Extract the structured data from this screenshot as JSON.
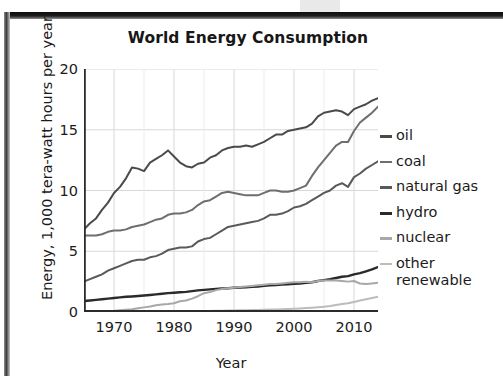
{
  "chart_data": {
    "type": "line",
    "title": "World Energy Consumption",
    "xlabel": "Year",
    "ylabel": "Energy, 1,000 tera-watt hours per year",
    "xlim": [
      1965,
      2014
    ],
    "ylim": [
      0,
      20
    ],
    "xticks": [
      "1970",
      "1980",
      "1990",
      "2000",
      "2010"
    ],
    "xtick_values": [
      1970,
      1980,
      1990,
      2000,
      2010
    ],
    "yticks": [
      "0",
      "5",
      "10",
      "15",
      "20"
    ],
    "ytick_values": [
      0,
      5,
      10,
      15,
      20
    ],
    "grid": "both",
    "legend_position": "right",
    "x": [
      1965,
      1966,
      1967,
      1968,
      1969,
      1970,
      1971,
      1972,
      1973,
      1974,
      1975,
      1976,
      1977,
      1978,
      1979,
      1980,
      1981,
      1982,
      1983,
      1984,
      1985,
      1986,
      1987,
      1988,
      1989,
      1990,
      1991,
      1992,
      1993,
      1994,
      1995,
      1996,
      1997,
      1998,
      1999,
      2000,
      2001,
      2002,
      2003,
      2004,
      2005,
      2006,
      2007,
      2008,
      2009,
      2010,
      2011,
      2012,
      2013,
      2014
    ],
    "series": [
      {
        "name": "oil",
        "color": "#4a4a4a",
        "values": [
          6.8,
          7.3,
          7.7,
          8.4,
          9.0,
          9.8,
          10.3,
          11.0,
          11.9,
          11.8,
          11.6,
          12.3,
          12.6,
          12.9,
          13.3,
          12.8,
          12.3,
          12.0,
          11.9,
          12.2,
          12.3,
          12.7,
          12.9,
          13.3,
          13.5,
          13.6,
          13.6,
          13.7,
          13.6,
          13.8,
          14.0,
          14.3,
          14.6,
          14.6,
          14.9,
          15.0,
          15.1,
          15.2,
          15.5,
          16.1,
          16.4,
          16.5,
          16.6,
          16.5,
          16.2,
          16.7,
          16.9,
          17.1,
          17.4,
          17.6
        ]
      },
      {
        "name": "coal",
        "color": "#6e6e6e",
        "values": [
          6.3,
          6.3,
          6.3,
          6.4,
          6.6,
          6.7,
          6.7,
          6.8,
          7.0,
          7.1,
          7.2,
          7.4,
          7.6,
          7.7,
          8.0,
          8.1,
          8.1,
          8.2,
          8.4,
          8.8,
          9.1,
          9.2,
          9.5,
          9.8,
          9.9,
          9.8,
          9.7,
          9.6,
          9.6,
          9.6,
          9.8,
          10.0,
          10.0,
          9.9,
          9.9,
          10.0,
          10.2,
          10.4,
          11.2,
          11.9,
          12.5,
          13.1,
          13.7,
          14.0,
          14.0,
          14.9,
          15.6,
          16.0,
          16.4,
          16.9
        ]
      },
      {
        "name": "natural gas",
        "color": "#5a5a5a",
        "values": [
          2.5,
          2.7,
          2.9,
          3.1,
          3.4,
          3.6,
          3.8,
          4.0,
          4.2,
          4.3,
          4.3,
          4.5,
          4.6,
          4.8,
          5.1,
          5.2,
          5.3,
          5.3,
          5.4,
          5.8,
          6.0,
          6.1,
          6.4,
          6.7,
          7.0,
          7.1,
          7.2,
          7.3,
          7.4,
          7.5,
          7.7,
          8.0,
          8.0,
          8.1,
          8.3,
          8.6,
          8.7,
          8.9,
          9.2,
          9.5,
          9.8,
          10.0,
          10.4,
          10.6,
          10.3,
          11.1,
          11.4,
          11.8,
          12.1,
          12.4
        ]
      },
      {
        "name": "hydro",
        "color": "#2a2a2a",
        "values": [
          0.9,
          0.95,
          1.0,
          1.05,
          1.1,
          1.15,
          1.2,
          1.25,
          1.28,
          1.32,
          1.36,
          1.4,
          1.45,
          1.5,
          1.55,
          1.58,
          1.62,
          1.66,
          1.72,
          1.78,
          1.82,
          1.86,
          1.9,
          1.94,
          1.95,
          2.0,
          2.02,
          2.03,
          2.08,
          2.1,
          2.15,
          2.2,
          2.22,
          2.25,
          2.28,
          2.33,
          2.35,
          2.4,
          2.45,
          2.55,
          2.62,
          2.7,
          2.8,
          2.9,
          2.95,
          3.1,
          3.2,
          3.35,
          3.5,
          3.7
        ]
      },
      {
        "name": "nuclear",
        "color": "#a8a8a8",
        "values": [
          0.02,
          0.03,
          0.04,
          0.06,
          0.08,
          0.1,
          0.14,
          0.18,
          0.22,
          0.3,
          0.38,
          0.45,
          0.55,
          0.62,
          0.66,
          0.72,
          0.88,
          0.95,
          1.1,
          1.3,
          1.55,
          1.65,
          1.8,
          1.9,
          1.95,
          2.0,
          2.05,
          2.1,
          2.15,
          2.2,
          2.25,
          2.3,
          2.3,
          2.35,
          2.4,
          2.45,
          2.45,
          2.5,
          2.45,
          2.55,
          2.6,
          2.6,
          2.6,
          2.55,
          2.5,
          2.55,
          2.35,
          2.3,
          2.35,
          2.4
        ]
      },
      {
        "name": "other renewable",
        "color": "#bcbcbc",
        "values": [
          0.01,
          0.01,
          0.01,
          0.01,
          0.02,
          0.02,
          0.02,
          0.02,
          0.03,
          0.03,
          0.03,
          0.04,
          0.04,
          0.05,
          0.05,
          0.06,
          0.06,
          0.07,
          0.07,
          0.08,
          0.09,
          0.09,
          0.1,
          0.11,
          0.12,
          0.13,
          0.14,
          0.15,
          0.16,
          0.17,
          0.18,
          0.2,
          0.21,
          0.23,
          0.25,
          0.27,
          0.29,
          0.32,
          0.35,
          0.39,
          0.44,
          0.5,
          0.57,
          0.65,
          0.72,
          0.83,
          0.95,
          1.05,
          1.15,
          1.25
        ]
      }
    ]
  },
  "legend": {
    "items": [
      {
        "label": "oil"
      },
      {
        "label": "coal"
      },
      {
        "label": "natural gas"
      },
      {
        "label": "hydro"
      },
      {
        "label": "nuclear"
      },
      {
        "label": "other renewable"
      }
    ]
  },
  "colors": {
    "grid": "#d8d8d8",
    "axis": "#2b2b2b",
    "text": "#1b1b1b",
    "background": "#ffffff"
  }
}
